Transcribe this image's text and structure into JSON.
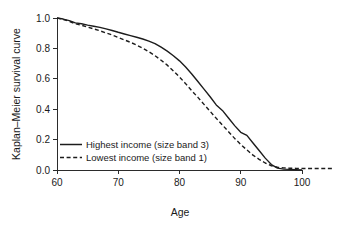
{
  "chart_data": {
    "type": "line",
    "title": "",
    "subtitle": "",
    "xlabel": "Age",
    "ylabel": "Kaplan–Meier survival curve",
    "xlim": [
      58.5,
      106
    ],
    "ylim": [
      -0.03,
      1.03
    ],
    "xticks": [
      60,
      70,
      80,
      90,
      100
    ],
    "xtick_labels": [
      "60",
      "70",
      "80",
      "90",
      "100"
    ],
    "yticks": [
      0.0,
      0.2,
      0.4,
      0.6,
      0.8,
      1.0
    ],
    "ytick_labels": [
      "0.0",
      "0.2",
      "0.4",
      "0.6",
      "0.8",
      "1.0"
    ],
    "grid": false,
    "legend_position": "center-left",
    "accent_color": "#1c1c1c",
    "series": [
      {
        "name": "Highest income (size band 3)",
        "line_style": "solid",
        "x": [
          60.0,
          61.0,
          62.0,
          63.0,
          64.0,
          65.0,
          66.0,
          67.0,
          68.0,
          69.0,
          70.0,
          71.0,
          72.0,
          73.0,
          74.0,
          75.0,
          76.0,
          77.0,
          78.0,
          79.0,
          80.0,
          81.0,
          82.0,
          83.0,
          84.0,
          85.0,
          86.0,
          87.0,
          88.0,
          89.0,
          90.0,
          91.0,
          92.0,
          93.0,
          94.0,
          95.0,
          96.0,
          97.0,
          98.0,
          99.0,
          100.0
        ],
        "y": [
          1.0,
          0.993,
          0.983,
          0.968,
          0.962,
          0.953,
          0.946,
          0.938,
          0.928,
          0.918,
          0.906,
          0.895,
          0.884,
          0.873,
          0.862,
          0.848,
          0.832,
          0.808,
          0.782,
          0.752,
          0.718,
          0.678,
          0.632,
          0.582,
          0.532,
          0.482,
          0.428,
          0.392,
          0.342,
          0.292,
          0.248,
          0.228,
          0.178,
          0.128,
          0.078,
          0.036,
          0.012,
          0.006,
          0.004,
          0.002,
          0.0
        ]
      },
      {
        "name": "Lowest income (size band 1)",
        "line_style": "dashed",
        "x": [
          60.0,
          61.0,
          62.0,
          63.0,
          64.0,
          65.0,
          66.0,
          67.0,
          68.0,
          69.0,
          70.0,
          71.0,
          72.0,
          73.0,
          74.0,
          75.0,
          76.0,
          77.0,
          78.0,
          79.0,
          80.0,
          81.0,
          82.0,
          83.0,
          84.0,
          85.0,
          86.0,
          87.0,
          88.0,
          89.0,
          90.0,
          91.0,
          92.0,
          93.0,
          94.0,
          95.0,
          96.0,
          97.0,
          98.0,
          99.0,
          100.0,
          101.0,
          102.0,
          103.0,
          104.0,
          105.0
        ],
        "y": [
          1.0,
          0.991,
          0.978,
          0.962,
          0.952,
          0.94,
          0.928,
          0.916,
          0.902,
          0.888,
          0.872,
          0.856,
          0.84,
          0.822,
          0.802,
          0.778,
          0.752,
          0.722,
          0.69,
          0.652,
          0.612,
          0.568,
          0.522,
          0.478,
          0.432,
          0.386,
          0.34,
          0.296,
          0.252,
          0.208,
          0.168,
          0.132,
          0.098,
          0.07,
          0.046,
          0.028,
          0.018,
          0.014,
          0.012,
          0.011,
          0.01,
          0.01,
          0.01,
          0.01,
          0.01,
          0.01
        ]
      }
    ]
  },
  "legend": {
    "entries": [
      {
        "label": "Highest income (size band 3)",
        "style": "solid"
      },
      {
        "label": "Lowest income (size band 1)",
        "style": "dashed"
      }
    ]
  }
}
